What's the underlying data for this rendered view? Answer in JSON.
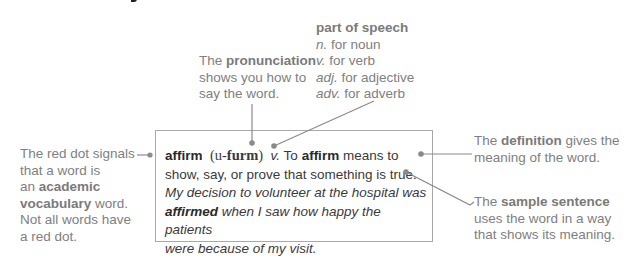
{
  "annotations": {
    "part_of_speech": {
      "title": "part of speech",
      "items": [
        {
          "abbr": "n.",
          "text": " for noun"
        },
        {
          "abbr": "v.",
          "text": " for verb"
        },
        {
          "abbr": "adj.",
          "text": " for adjective"
        },
        {
          "abbr": "adv.",
          "text": " for adverb"
        }
      ]
    },
    "pronunciation": {
      "pre": "The ",
      "bold": "pronunciation",
      "line2": "shows you how to",
      "line3": "say the word."
    },
    "red_dot": {
      "line1": "The red dot signals",
      "line2": "that a word is",
      "line3_pre": "an ",
      "line3_bold": "academic",
      "line4_bold": "vocabulary",
      "line4_post": " word.",
      "line5": "Not all words have",
      "line6": "a red dot."
    },
    "definition": {
      "pre": "The ",
      "bold": "definition",
      "post": " gives the",
      "line2": "meaning of the word."
    },
    "sample_sentence": {
      "pre": "The ",
      "bold": "sample sentence",
      "line2": "uses the word in a way",
      "line3": "that shows its meaning."
    }
  },
  "entry": {
    "headword": "affirm",
    "pron_open": "(u-",
    "pron_bold": "furm",
    "pron_close": ")",
    "pos": "v.",
    "def_pre": " To ",
    "def_kw": "affirm",
    "def_post": " means to",
    "def_line2": "show, say, or prove that something is true.",
    "sample_line1": "My decision to volunteer at the hospital was",
    "sample_bold": "affirmed",
    "sample_line2_post": " when I saw how happy the patients",
    "sample_line3": "were because of my visit."
  },
  "colors": {
    "annotation_text": "#808080",
    "body_text": "#3a3a3a",
    "leader_line": "#8a8a8a",
    "box_border": "#a9a9a9"
  }
}
